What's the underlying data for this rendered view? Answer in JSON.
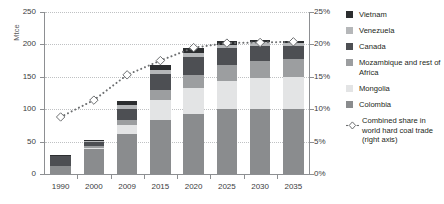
{
  "chart_data": {
    "type": "bar",
    "subtype": "stacked-bar-with-line",
    "title": "",
    "ylabel": "Mtce",
    "y2label": "",
    "xlabel": "",
    "ylim": [
      0,
      250
    ],
    "y2lim": [
      0,
      25
    ],
    "grid": true,
    "legend_position": "right",
    "categories": [
      "1990",
      "2000",
      "2009",
      "2015",
      "2020",
      "2025",
      "2030",
      "2035"
    ],
    "ytick_labels": [
      "0",
      "50",
      "100",
      "150",
      "200",
      "250"
    ],
    "ytick_values": [
      0,
      50,
      100,
      150,
      200,
      250
    ],
    "y2tick_labels": [
      "0%",
      "5%",
      "10%",
      "15%",
      "20%",
      "25%"
    ],
    "y2tick_values": [
      0,
      5,
      10,
      15,
      20,
      25
    ],
    "series": [
      {
        "name": "Colombia",
        "color": "#8a8c8e",
        "values": [
          13,
          38,
          61,
          83,
          93,
          100,
          100,
          100
        ]
      },
      {
        "name": "Mongolia",
        "color": "#e3e4e5",
        "values": [
          0,
          2,
          15,
          32,
          40,
          44,
          48,
          50
        ]
      },
      {
        "name": "Mozambique and rest of Africa",
        "color": "#9c9ea0",
        "values": [
          0,
          3,
          7,
          14,
          20,
          24,
          26,
          28
        ]
      },
      {
        "name": "Canada",
        "color": "#4d4f53",
        "values": [
          15,
          6,
          18,
          26,
          28,
          26,
          24,
          20
        ]
      },
      {
        "name": "Venezuela",
        "color": "#b5b7b9",
        "values": [
          1,
          2,
          5,
          6,
          6,
          5,
          5,
          4
        ]
      },
      {
        "name": "Vietnam",
        "color": "#2c2e30",
        "values": [
          1,
          2,
          6,
          8,
          8,
          6,
          4,
          3
        ]
      }
    ],
    "line_series": {
      "name": "Combined share in world hard coal trade (right axis)",
      "axis": "right",
      "style": "dotted",
      "marker": "diamond",
      "marker_color": "#ffffff",
      "line_color": "#6d6f71",
      "values": [
        8.8,
        11.4,
        15.3,
        17.5,
        19.5,
        20.2,
        20.3,
        20.4
      ]
    }
  },
  "legend": {
    "items": [
      {
        "label": "Vietnam",
        "color": "#2c2e30"
      },
      {
        "label": "Venezuela",
        "color": "#b5b7b9"
      },
      {
        "label": "Canada",
        "color": "#4d4f53"
      },
      {
        "label": "Mozambique and rest of Africa",
        "color": "#9c9ea0"
      },
      {
        "label": "Mongolia",
        "color": "#e3e4e5"
      },
      {
        "label": "Colombia",
        "color": "#8a8c8e"
      }
    ],
    "line_item": {
      "label": "Combined share in world hard coal trade (right axis)"
    }
  }
}
